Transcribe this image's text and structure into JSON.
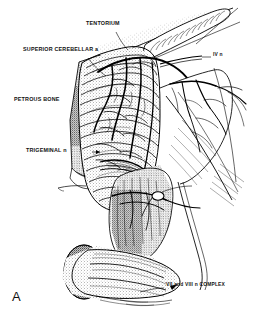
{
  "figure": {
    "panel_letter": "A",
    "caption_text": "",
    "background_color": "#ffffff",
    "ink_color": "#000000",
    "width": 257,
    "height": 321,
    "style": "pen-and-ink stipple line drawing"
  },
  "labels": [
    {
      "id": "tentorium",
      "text": "TENTORIUM",
      "x": 86,
      "y": 24,
      "align": "left",
      "leader": true
    },
    {
      "id": "superior-cerebellar-artery",
      "text": "SUPERIOR CEREBELLAR a",
      "x": 23,
      "y": 50,
      "align": "left",
      "leader": true
    },
    {
      "id": "iv-nerve",
      "text": "IV n",
      "x": 213,
      "y": 56,
      "align": "left",
      "leader": true
    },
    {
      "id": "petrous-bone",
      "text": "PETROUS BONE",
      "x": 14,
      "y": 100,
      "align": "left",
      "leader": false
    },
    {
      "id": "trigeminal-nerve",
      "text": "TRIGEMINAL n",
      "x": 26,
      "y": 150,
      "align": "left",
      "leader": true
    },
    {
      "id": "vii-viii-complex",
      "text": "VII and VIII n COMPLEX",
      "x": 166,
      "y": 285,
      "align": "left",
      "leader": true
    }
  ],
  "structures": [
    {
      "id": "tentorium-edge",
      "name": "tentorial edge"
    },
    {
      "id": "cerebellum",
      "name": "cerebellar hemisphere with folia"
    },
    {
      "id": "petrous-bone-surface",
      "name": "petrous bone face"
    },
    {
      "id": "superior-cerebellar-artery-trunk",
      "name": "superior cerebellar artery"
    },
    {
      "id": "trochlear-nerve",
      "name": "trochlear nerve (IV)"
    },
    {
      "id": "trigeminal-nerve-root",
      "name": "trigeminal nerve root (V)"
    },
    {
      "id": "facial-vestibulocochlear-bundle",
      "name": "VII and VIII nerve complex"
    },
    {
      "id": "brainstem",
      "name": "brainstem / pons lateral surface"
    },
    {
      "id": "vascular-network",
      "name": "arterial branches over tentorium"
    }
  ]
}
